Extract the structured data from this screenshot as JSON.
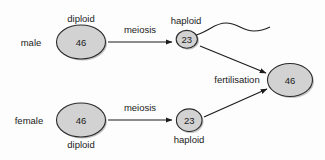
{
  "diagram": {
    "colors": {
      "cell_fill": "#d2d2d2",
      "cell_stroke": "#2b2b2b",
      "cell_shadow": "#b9b9b9",
      "arrow": "#1c1c1c",
      "text": "#1a1a1a",
      "background": "#fdfdfd"
    },
    "nodes": {
      "male_parent": {
        "sex_label": "male",
        "ploidy_label": "diploid",
        "chromosome_number": "46"
      },
      "male_gamete": {
        "ploidy_label": "haploid",
        "chromosome_number": "23",
        "icon": "sperm-cell-icon"
      },
      "female_parent": {
        "sex_label": "female",
        "ploidy_label": "diploid",
        "chromosome_number": "46"
      },
      "female_gamete": {
        "ploidy_label": "haploid",
        "chromosome_number": "23",
        "icon": "egg-cell-icon"
      },
      "zygote": {
        "chromosome_number": "46"
      }
    },
    "processes": {
      "meiosis_male": "meiosis",
      "meiosis_female": "meiosis",
      "fertilisation": "fertilisation"
    }
  }
}
